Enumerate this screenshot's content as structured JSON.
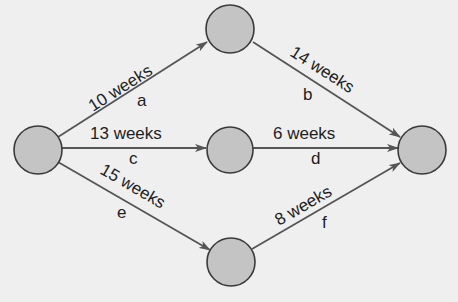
{
  "diagram": {
    "type": "activity-on-arrow network",
    "colors": {
      "background": "#efefef",
      "node_fill": "#c4c4c4",
      "node_stroke": "#3a3a3a",
      "edge": "#555555",
      "text": "#1e1e1e"
    },
    "nodes": [
      {
        "id": "start",
        "x": 38,
        "y": 150
      },
      {
        "id": "top",
        "x": 230,
        "y": 29
      },
      {
        "id": "middle",
        "x": 230,
        "y": 150
      },
      {
        "id": "end",
        "x": 422,
        "y": 150
      },
      {
        "id": "bottom",
        "x": 231,
        "y": 262
      }
    ],
    "edges": [
      {
        "activity": "a",
        "duration": "10 weeks",
        "from": "start",
        "to": "top"
      },
      {
        "activity": "b",
        "duration": "14 weeks",
        "from": "top",
        "to": "end"
      },
      {
        "activity": "c",
        "duration": "13 weeks",
        "from": "start",
        "to": "middle"
      },
      {
        "activity": "d",
        "duration": "6 weeks",
        "from": "middle",
        "to": "end"
      },
      {
        "activity": "e",
        "duration": "15 weeks",
        "from": "start",
        "to": "bottom"
      },
      {
        "activity": "f",
        "duration": "8 weeks",
        "from": "bottom",
        "to": "end"
      }
    ]
  }
}
